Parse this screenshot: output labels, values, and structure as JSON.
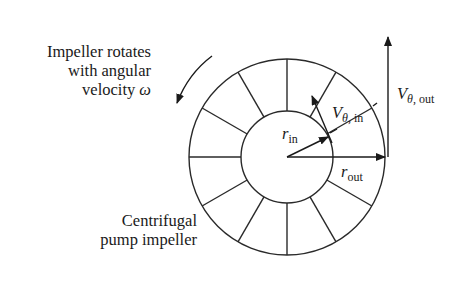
{
  "diagram": {
    "labels": {
      "rotation_line1": "Impeller rotates",
      "rotation_line2": "with angular",
      "rotation_line3": "velocity ",
      "omega": "ω",
      "impeller_line1": "Centrifugal",
      "impeller_line2": "pump impeller",
      "r_in_main": "r",
      "r_in_sub": "in",
      "r_out_main": "r",
      "r_out_sub": "out",
      "v_in_main": "V",
      "v_in_theta": "θ",
      "v_in_sub": ", in",
      "v_out_main": "V",
      "v_out_theta": "θ",
      "v_out_sub": ", out"
    },
    "geometry": {
      "center": [
        287,
        157
      ],
      "outer_radius": 98,
      "inner_radius": 46,
      "blade_count": 12,
      "stroke_color": "#2a2a2a"
    }
  }
}
